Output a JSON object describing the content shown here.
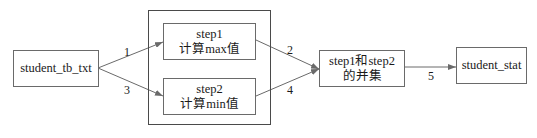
{
  "nodes": {
    "source": {
      "label": "student_tb_txt"
    },
    "group": {
      "step1": {
        "line1": "step1",
        "line2": "计算max值"
      },
      "step2": {
        "line1": "step2",
        "line2": "计算min值"
      }
    },
    "union": {
      "line1": "step1和step2",
      "line2": "的并集"
    },
    "target": {
      "label": "student_stat"
    }
  },
  "edges": [
    {
      "from": "student_tb_txt",
      "to": "step1",
      "label": "1"
    },
    {
      "from": "step1",
      "to": "union",
      "label": "2"
    },
    {
      "from": "student_tb_txt",
      "to": "step2",
      "label": "3"
    },
    {
      "from": "step2",
      "to": "union",
      "label": "4"
    },
    {
      "from": "union",
      "to": "student_stat",
      "label": "5"
    }
  ],
  "colors": {
    "line": "#6a6a6a",
    "text": "#1a1a1a"
  }
}
